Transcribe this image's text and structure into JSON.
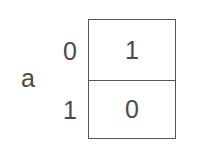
{
  "diagram": {
    "type": "karnaugh-map",
    "variable": "a",
    "rows": [
      {
        "input": "0",
        "output": "1"
      },
      {
        "input": "1",
        "output": "0"
      }
    ]
  }
}
